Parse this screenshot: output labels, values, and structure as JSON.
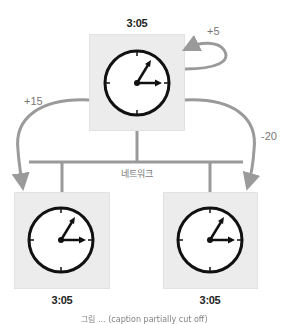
{
  "diagram": {
    "top_node": {
      "time": "3:05",
      "self_adjustment": "+5"
    },
    "left_node": {
      "time": "3:05",
      "adjustment": "+15"
    },
    "right_node": {
      "time": "3:05",
      "adjustment": "-20"
    },
    "network_label": "네트워크",
    "caption": "그림 ... (caption partially cut off)"
  },
  "colors": {
    "box_fill": "#ececec",
    "arrow": "#9a9a9a",
    "network_line": "#9a9a9a",
    "clock_stroke": "#111111",
    "clock_face": "#ffffff"
  }
}
